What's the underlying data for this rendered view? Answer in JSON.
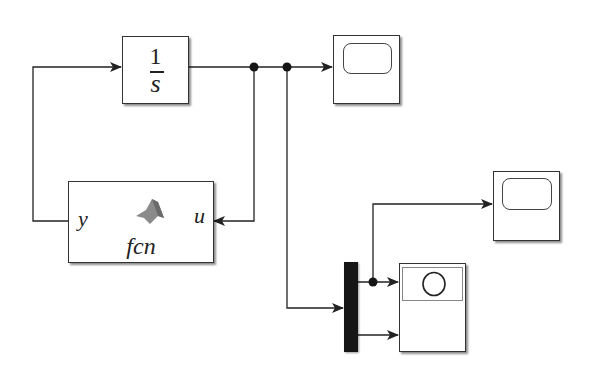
{
  "diagram": {
    "type": "simulink-block-diagram",
    "blocks": {
      "integrator": {
        "numerator": "1",
        "denominator": "s"
      },
      "matlab_function": {
        "input_port": "y",
        "output_port": "u",
        "name": "fcn"
      },
      "scope_1": {
        "kind": "scope"
      },
      "scope_2": {
        "kind": "scope"
      },
      "mux": {
        "kind": "mux",
        "inputs": 2
      },
      "xy_graph": {
        "kind": "xy-graph"
      }
    },
    "connections": [
      {
        "from": "matlab_function.y",
        "to": "integrator.in"
      },
      {
        "from": "integrator.out",
        "to": "scope_1"
      },
      {
        "from": "integrator.out",
        "to": "matlab_function.u"
      },
      {
        "from": "integrator.out",
        "to": "mux.in2"
      },
      {
        "from": "mux.out",
        "to": "scope_2"
      },
      {
        "from": "mux.out1",
        "to": "xy_graph.in1"
      },
      {
        "from": "mux.out2",
        "to": "xy_graph.in2"
      }
    ],
    "colors": {
      "line": "#222222",
      "mux": "#151515",
      "background": "#ffffff"
    }
  }
}
